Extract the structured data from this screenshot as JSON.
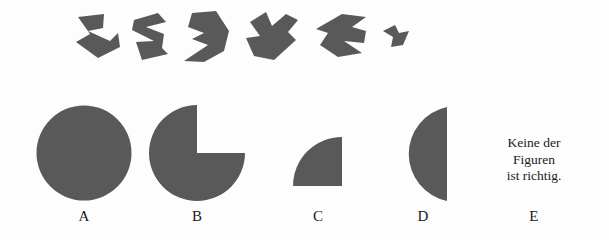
{
  "page": {
    "background_color": "#fdfdfd",
    "shape_color": "#595959",
    "text_color": "#1a1a1a",
    "width": 609,
    "height": 240
  },
  "puzzle": {
    "type": "shape-assembly-multiple-choice",
    "pieces": [
      {
        "id": "piece-1",
        "name": "fragment-1",
        "x": 74,
        "y": 11,
        "w": 48,
        "h": 48,
        "path": "M 4,6 L 30,3 L 29,17 L 14,20 L 36,30 L 44,22 L 46,36 L 24,47 L 2,31 L 16,23 Z"
      },
      {
        "id": "piece-2",
        "name": "fragment-2",
        "x": 128,
        "y": 10,
        "w": 44,
        "h": 52,
        "path": "M 6,10 L 30,3 L 38,12 L 18,17 L 36,24 L 34,38 L 40,44 L 14,50 L 8,32 L 26,31 L 4,20 Z"
      },
      {
        "id": "piece-3",
        "name": "fragment-3",
        "x": 182,
        "y": 9,
        "w": 50,
        "h": 55,
        "path": "M 10,4 L 34,2 L 47,22 L 42,42 L 22,53 L 2,52 L 26,36 L 10,30 L 22,24 L 6,18 Z"
      },
      {
        "id": "piece-4",
        "name": "fragment-4",
        "x": 244,
        "y": 10,
        "w": 56,
        "h": 54,
        "path": "M 6,12 L 22,2 L 28,16 L 42,4 L 54,10 L 44,22 L 52,30 L 30,50 L 10,46 L 2,28 L 16,26 Z"
      },
      {
        "id": "piece-5",
        "name": "fragment-5",
        "x": 314,
        "y": 11,
        "w": 54,
        "h": 48,
        "path": "M 28,3 L 52,6 L 38,16 L 52,20 L 50,32 L 30,30 L 48,42 L 24,46 L 6,34 L 14,22 L 2,18 Z"
      },
      {
        "id": "piece-6",
        "name": "fragment-6",
        "x": 381,
        "y": 23,
        "w": 30,
        "h": 26,
        "path": "M 2,8 L 14,2 L 18,10 L 28,8 L 22,22 L 10,24 L 12,14 Z"
      }
    ],
    "options": [
      {
        "id": "option-a",
        "label": "A",
        "shape": "full-circle",
        "shape_name": "full-circle-shape",
        "x": 36,
        "y": 105,
        "w": 96,
        "h": 96,
        "label_x": 36,
        "label_y": 208,
        "label_w": 96
      },
      {
        "id": "option-b",
        "label": "B",
        "shape": "three-quarter-circle",
        "shape_name": "pacman-three-quarter-circle-shape",
        "x": 148,
        "y": 104,
        "w": 98,
        "h": 98,
        "label_x": 148,
        "label_y": 208,
        "label_w": 98
      },
      {
        "id": "option-c",
        "label": "C",
        "shape": "quarter-circle",
        "shape_name": "quarter-circle-shape",
        "x": 293,
        "y": 137,
        "w": 50,
        "h": 50,
        "label_x": 268,
        "label_y": 208,
        "label_w": 100
      },
      {
        "id": "option-d",
        "label": "D",
        "shape": "half-circle-left",
        "shape_name": "half-circle-shape",
        "x": 398,
        "y": 106,
        "w": 50,
        "h": 96,
        "label_x": 373,
        "label_y": 208,
        "label_w": 100
      },
      {
        "id": "option-e",
        "label": "E",
        "shape": "text",
        "shape_name": "none-of-the-figures-text",
        "text_lines": [
          "Keine der",
          "Figuren",
          "ist richtig."
        ],
        "x": 478,
        "y": 135,
        "w": 112,
        "h": 56,
        "label_x": 478,
        "label_y": 208,
        "label_w": 112
      }
    ]
  }
}
